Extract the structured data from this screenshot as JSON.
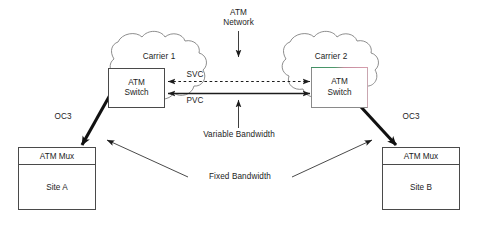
{
  "diagram": {
    "background_color": "#ffffff",
    "line_color": "#1c1c1c",
    "accent_green": "#3f8f62",
    "accent_pink": "#c48a9c"
  },
  "network_label": {
    "line1": "ATM",
    "line2": "Network"
  },
  "clouds": [
    {
      "id": "carrier1",
      "label": "Carrier 1"
    },
    {
      "id": "carrier2",
      "label": "Carrier 2"
    }
  ],
  "switches": [
    {
      "id": "switch1",
      "line1": "ATM",
      "line2": "Switch"
    },
    {
      "id": "switch2",
      "line1": "ATM",
      "line2": "Switch"
    }
  ],
  "muxes": [
    {
      "id": "mux-a",
      "header": "ATM Mux",
      "site": "Site A"
    },
    {
      "id": "mux-b",
      "header": "ATM Mux",
      "site": "Site B"
    }
  ],
  "links": {
    "svc": "SVC",
    "pvc": "PVC",
    "oc3_left": "OC3",
    "oc3_right": "OC3"
  },
  "annotations": {
    "variable_bandwidth": "Variable Bandwidth",
    "fixed_bandwidth": "Fixed Bandwidth"
  }
}
